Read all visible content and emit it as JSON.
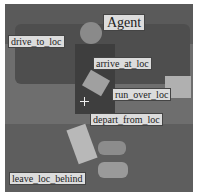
{
  "scene": {
    "description": "grayscale video frame with a person (agent) near a vehicle and objects on the ground",
    "colors": {
      "background": "#6e6e6e",
      "label_bg": "#dcdcdc",
      "label_border": "#444444",
      "label_text": "#222222"
    }
  },
  "labels": [
    {
      "id": "agent",
      "text": "Agent"
    },
    {
      "id": "drive_to_loc",
      "text": "drive_to_loc"
    },
    {
      "id": "arrive_at_loc",
      "text": "arrive_at_loc"
    },
    {
      "id": "run_over_loc",
      "text": "run_over_loc"
    },
    {
      "id": "depart_from_loc",
      "text": "depart_from_loc"
    },
    {
      "id": "leave_loc_behind",
      "text": "leave_loc_behind"
    }
  ],
  "marker": {
    "type": "crosshair"
  }
}
